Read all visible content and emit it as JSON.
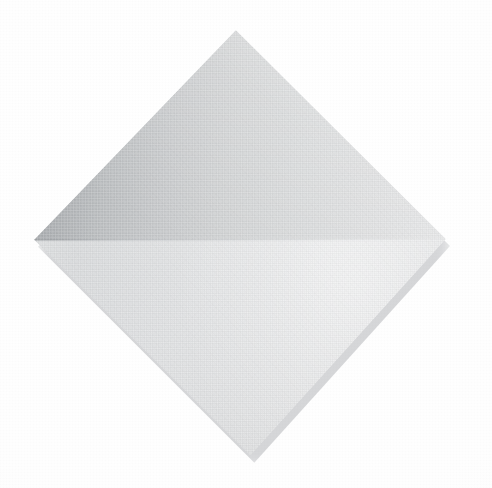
{
  "image": {
    "subject": "folded-napkin",
    "description": "Photograph of a square cloth napkin folded once along the horizontal diagonal, presented as a diamond on a plain white surface",
    "background_color": "#fdfdfd",
    "frame": {
      "width": 492,
      "height": 488
    }
  },
  "napkin": {
    "shape": "diamond",
    "label": "folded napkin",
    "vertices": {
      "top": {
        "x": 235,
        "y": 29
      },
      "right": {
        "x": 444,
        "y": 238
      },
      "bottom": {
        "x": 250,
        "y": 456
      },
      "left": {
        "x": 35,
        "y": 239
      }
    },
    "fold_line": {
      "name": "horizontal-fold",
      "orientation": "horizontal",
      "y": 238,
      "from_x": 35,
      "to_x": 444
    },
    "upper_panel": {
      "name": "upper-fold-panel",
      "tone": "medium grey",
      "darkest_color": "#9fa3a6",
      "lightest_color": "#e7e8e8",
      "shading_direction": "dark at left vertex, light toward right vertex"
    },
    "lower_panel": {
      "name": "lower-fold-panel",
      "tone": "near white",
      "darkest_color": "#dcdddd",
      "lightest_color": "#f4f5f5",
      "shading_direction": "light at upper right, slightly shaded toward lower left"
    },
    "creases": [
      {
        "name": "lower-right-inner-crease",
        "edge": "lower-right",
        "strength": "faint"
      },
      {
        "name": "lower-right-secondary-crease",
        "edge": "lower-right",
        "strength": "very faint"
      }
    ],
    "shadow": {
      "name": "contact-shadow",
      "color": "#787c82",
      "offset_x": 4,
      "offset_y": 7,
      "blur": 7
    },
    "texture": "woven cloth weave"
  }
}
